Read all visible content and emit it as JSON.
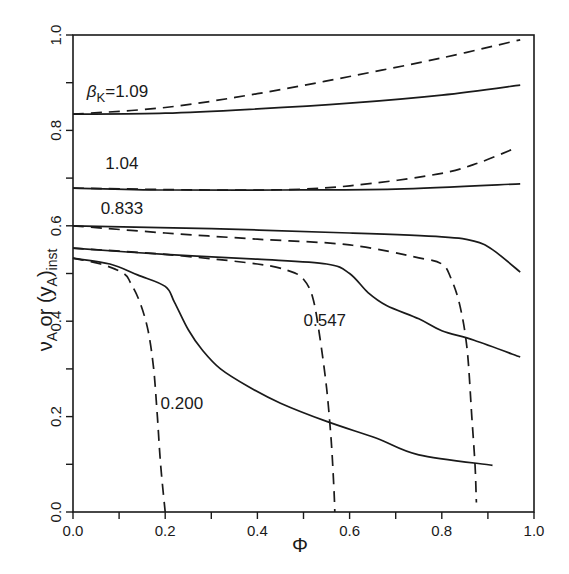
{
  "chart_data": {
    "type": "line",
    "title": "",
    "xlabel": "Φ",
    "ylabel": "ν_A or (y_A)_inst",
    "xlim": [
      0.0,
      1.0
    ],
    "ylim": [
      0.0,
      1.0
    ],
    "grid": false,
    "legend": "none (curves labeled inline by β_K)",
    "x_ticks": [
      "0.0",
      "0.2",
      "0.4",
      "0.6",
      "0.8",
      "1.0"
    ],
    "y_ticks": [
      "0.0",
      "0.2",
      "0.4",
      "0.6",
      "0.8",
      "1.0"
    ],
    "minor_ticks_every": 0.1,
    "line_styles": {
      "solid": "ν_A",
      "dashed": "(y_A)_inst"
    },
    "series": [
      {
        "name": "βK=1.09 solid",
        "beta": "1.09",
        "style": "solid",
        "points": [
          [
            0,
            0.834
          ],
          [
            0.2,
            0.836
          ],
          [
            0.4,
            0.845
          ],
          [
            0.6,
            0.857
          ],
          [
            0.8,
            0.874
          ],
          [
            0.97,
            0.895
          ]
        ]
      },
      {
        "name": "βK=1.09 dashed",
        "beta": "1.09",
        "style": "dashed",
        "points": [
          [
            0,
            0.834
          ],
          [
            0.2,
            0.848
          ],
          [
            0.4,
            0.877
          ],
          [
            0.6,
            0.913
          ],
          [
            0.8,
            0.952
          ],
          [
            0.97,
            0.99
          ]
        ]
      },
      {
        "name": "βK=1.04 solid",
        "beta": "1.04",
        "style": "solid",
        "points": [
          [
            0,
            0.679
          ],
          [
            0.2,
            0.675
          ],
          [
            0.45,
            0.675
          ],
          [
            0.7,
            0.677
          ],
          [
            0.97,
            0.688
          ]
        ]
      },
      {
        "name": "βK=1.04 dashed",
        "beta": "1.04",
        "style": "dashed",
        "points": [
          [
            0,
            0.679
          ],
          [
            0.3,
            0.675
          ],
          [
            0.5,
            0.677
          ],
          [
            0.65,
            0.689
          ],
          [
            0.8,
            0.71
          ],
          [
            0.88,
            0.732
          ],
          [
            0.96,
            0.763
          ]
        ]
      },
      {
        "name": "βK=0.833 solid",
        "beta": "0.833",
        "style": "solid",
        "points": [
          [
            0,
            0.6
          ],
          [
            0.3,
            0.594
          ],
          [
            0.6,
            0.585
          ],
          [
            0.8,
            0.577
          ],
          [
            0.87,
            0.568
          ],
          [
            0.91,
            0.55
          ],
          [
            0.97,
            0.503
          ]
        ]
      },
      {
        "name": "βK=0.833 dashed",
        "beta": "0.833",
        "style": "dashed",
        "points": [
          [
            0,
            0.6
          ],
          [
            0.2,
            0.585
          ],
          [
            0.4,
            0.572
          ],
          [
            0.6,
            0.56
          ],
          [
            0.75,
            0.533
          ],
          [
            0.8,
            0.52
          ],
          [
            0.82,
            0.49
          ],
          [
            0.84,
            0.43
          ],
          [
            0.855,
            0.34
          ],
          [
            0.865,
            0.2
          ],
          [
            0.872,
            0.1
          ],
          [
            0.875,
            0.02
          ]
        ]
      },
      {
        "name": "βK=0.547 solid",
        "beta": "0.547",
        "style": "solid",
        "points": [
          [
            0,
            0.553
          ],
          [
            0.2,
            0.54
          ],
          [
            0.4,
            0.53
          ],
          [
            0.55,
            0.52
          ],
          [
            0.6,
            0.5
          ],
          [
            0.64,
            0.46
          ],
          [
            0.68,
            0.433
          ],
          [
            0.75,
            0.405
          ],
          [
            0.8,
            0.38
          ],
          [
            0.87,
            0.36
          ],
          [
            0.97,
            0.325
          ]
        ]
      },
      {
        "name": "βK=0.547 dashed",
        "beta": "0.547",
        "style": "dashed",
        "points": [
          [
            0,
            0.553
          ],
          [
            0.2,
            0.54
          ],
          [
            0.4,
            0.52
          ],
          [
            0.47,
            0.505
          ],
          [
            0.5,
            0.488
          ],
          [
            0.52,
            0.45
          ],
          [
            0.535,
            0.37
          ],
          [
            0.55,
            0.26
          ],
          [
            0.56,
            0.15
          ],
          [
            0.566,
            0.05
          ],
          [
            0.568,
            0.0
          ]
        ]
      },
      {
        "name": "βK=0.200 solid",
        "beta": "0.200",
        "style": "solid",
        "points": [
          [
            0,
            0.532
          ],
          [
            0.08,
            0.52
          ],
          [
            0.14,
            0.497
          ],
          [
            0.2,
            0.473
          ],
          [
            0.22,
            0.44
          ],
          [
            0.25,
            0.382
          ],
          [
            0.28,
            0.34
          ],
          [
            0.32,
            0.3
          ],
          [
            0.38,
            0.263
          ],
          [
            0.45,
            0.228
          ],
          [
            0.55,
            0.19
          ],
          [
            0.66,
            0.154
          ],
          [
            0.75,
            0.12
          ],
          [
            0.91,
            0.098
          ]
        ]
      },
      {
        "name": "βK=0.200 dashed",
        "beta": "0.200",
        "style": "dashed",
        "points": [
          [
            0,
            0.532
          ],
          [
            0.06,
            0.52
          ],
          [
            0.11,
            0.5
          ],
          [
            0.125,
            0.48
          ],
          [
            0.145,
            0.44
          ],
          [
            0.163,
            0.38
          ],
          [
            0.175,
            0.3
          ],
          [
            0.183,
            0.2
          ],
          [
            0.19,
            0.1
          ],
          [
            0.2,
            0.0
          ]
        ]
      }
    ],
    "annotations": [
      {
        "text": "βK=1.09",
        "prefix": "β",
        "sub": "K",
        "value": "=1.09",
        "x": 0.03,
        "y": 0.87
      },
      {
        "text": "1.04",
        "x": 0.07,
        "y": 0.72
      },
      {
        "text": "0.833",
        "x": 0.06,
        "y": 0.625
      },
      {
        "text": "0.547",
        "x": 0.5,
        "y": 0.39
      },
      {
        "text": "0.200",
        "x": 0.19,
        "y": 0.215
      }
    ]
  },
  "labels": {
    "x_axis_title": "Φ",
    "y_axis_title_main": "ν",
    "y_axis_title_sub_a": "A",
    "y_axis_title_or": " or (y",
    "y_axis_title_sub_b": "A",
    "y_axis_title_close": ")",
    "y_axis_title_sub_inst": "inst"
  }
}
